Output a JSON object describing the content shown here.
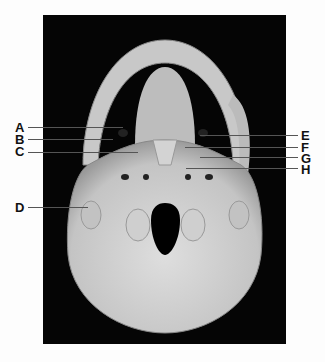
{
  "figure": {
    "labels_left": [
      {
        "letter": "A",
        "y": 127
      },
      {
        "letter": "B",
        "y": 139
      },
      {
        "letter": "C",
        "y": 151
      },
      {
        "letter": "D",
        "y": 207
      }
    ],
    "labels_right": [
      {
        "letter": "E",
        "y": 135
      },
      {
        "letter": "F",
        "y": 147
      },
      {
        "letter": "G",
        "y": 158
      },
      {
        "letter": "H",
        "y": 169
      }
    ],
    "colors": {
      "background": "#050505",
      "bone": "#cfcfcf",
      "label_text": "#111111",
      "leader_line": "#555555"
    }
  }
}
